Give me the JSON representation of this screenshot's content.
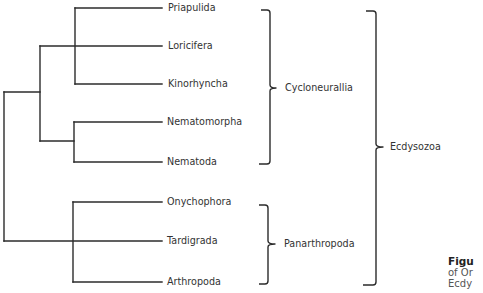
{
  "diagram": {
    "type": "phylogenetic-tree",
    "leaves": [
      {
        "id": "priapulida",
        "label": "Priapulida"
      },
      {
        "id": "loricifera",
        "label": "Loricifera"
      },
      {
        "id": "kinorhyncha",
        "label": "Kinorhyncha"
      },
      {
        "id": "nematomorpha",
        "label": "Nematomorpha"
      },
      {
        "id": "nematoda",
        "label": "Nematoda"
      },
      {
        "id": "onychophora",
        "label": "Onychophora"
      },
      {
        "id": "tardigrada",
        "label": "Tardigrada"
      },
      {
        "id": "arthropoda",
        "label": "Arthropoda"
      }
    ],
    "topology": "((((Priapulida,Kinorhyncha),Loricifera),(Nematomorpha,Nematoda)),((Onychophora,Arthropoda),Tardigrada))",
    "groups": [
      {
        "id": "cycloneuralia",
        "label": "Cycloneurallia",
        "members": [
          "Priapulida",
          "Loricifera",
          "Kinorhyncha",
          "Nematomorpha",
          "Nematoda"
        ]
      },
      {
        "id": "panarthropoda",
        "label": "Panarthropoda",
        "members": [
          "Onychophora",
          "Tardigrada",
          "Arthropoda"
        ]
      },
      {
        "id": "ecdysozoa",
        "label": "Ecdysozoa",
        "members": [
          "Cycloneurallia",
          "Panarthropoda"
        ]
      }
    ]
  },
  "caption": {
    "title": "Figu",
    "line1": "of Or",
    "line2": "Ecdy"
  }
}
